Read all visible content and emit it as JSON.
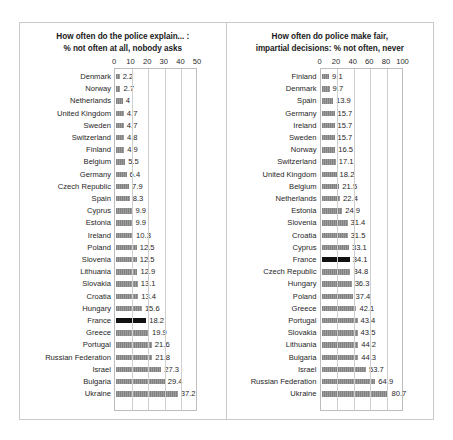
{
  "chart_data": [
    {
      "type": "bar",
      "orientation": "horizontal",
      "title": "How often do the police explain... : % not often at all, nobody asks",
      "title_lines": [
        "How often do the police explain... :",
        "% not often at all, nobody asks"
      ],
      "xlabel": "",
      "ylabel": "",
      "xlim": [
        0,
        50
      ],
      "xticks": [
        0,
        10,
        20,
        30,
        40,
        50
      ],
      "grid": true,
      "legend": "none",
      "highlight_category": "France",
      "highlight_color": "#111111",
      "bar_color": "#8e8e8e",
      "categories": [
        "Denmark",
        "Norway",
        "Netherlands",
        "United Kingdom",
        "Sweden",
        "Switzerland",
        "Finland",
        "Belgium",
        "Germany",
        "Czech Republic",
        "Spain",
        "Cyprus",
        "Estonia",
        "Ireland",
        "Poland",
        "Slovenia",
        "Lithuania",
        "Slovakia",
        "Croatia",
        "Hungary",
        "France",
        "Greece",
        "Portugal",
        "Russian Federation",
        "Israel",
        "Bulgaria",
        "Ukraine"
      ],
      "values": [
        2.2,
        2.7,
        4,
        4.7,
        4.7,
        4.8,
        4.9,
        5.5,
        6.4,
        7.9,
        8.3,
        9.9,
        9.9,
        10.3,
        12.5,
        12.5,
        12.9,
        13.1,
        13.4,
        15.6,
        18.2,
        19.9,
        21.6,
        21.8,
        27.3,
        29.4,
        37.2
      ],
      "labels": [
        "2.2",
        "2.7",
        "4",
        "4.7",
        "4.7",
        "4.8",
        "4.9",
        "5.5",
        "6.4",
        "7.9",
        "8.3",
        "9.9",
        "9.9",
        "10.3",
        "12.5",
        "12.5",
        "12.9",
        "13.1",
        "13.4",
        "15.6",
        "18.2",
        "19.9",
        "21.6",
        "21.8",
        "27.3",
        "29.4",
        "37.2"
      ]
    },
    {
      "type": "bar",
      "orientation": "horizontal",
      "title": "How often do police make fair, impartial decisions: % not often, never",
      "title_lines": [
        "How often do police make fair,",
        "impartial decisions: % not often, never"
      ],
      "xlabel": "",
      "ylabel": "",
      "xlim": [
        0,
        100
      ],
      "xticks": [
        0,
        20,
        40,
        60,
        80,
        100
      ],
      "grid": true,
      "legend": "none",
      "highlight_category": "France",
      "highlight_color": "#111111",
      "bar_color": "#8e8e8e",
      "categories": [
        "Finland",
        "Denmark",
        "Spain",
        "Germany",
        "Ireland",
        "Sweden",
        "Norway",
        "Switzerland",
        "United Kingdom",
        "Belgium",
        "Netherlands",
        "Estonia",
        "Slovenia",
        "Croatia",
        "Cyprus",
        "France",
        "Czech Republic",
        "Hungary",
        "Poland",
        "Greece",
        "Portugal",
        "Slovakia",
        "Lithuania",
        "Bulgaria",
        "Israel",
        "Russian Federation",
        "Ukraine"
      ],
      "values": [
        9.1,
        9.7,
        13.9,
        15.7,
        15.7,
        15.7,
        16.5,
        17.1,
        18.2,
        21.5,
        22.4,
        24.9,
        31.4,
        31.5,
        33.1,
        34.1,
        34.8,
        36.3,
        37.4,
        42.1,
        43.4,
        43.5,
        44.2,
        44.3,
        53.7,
        64.9,
        80.7
      ],
      "labels": [
        "9.1",
        "9.7",
        "13.9",
        "15.7",
        "15.7",
        "15.7",
        "16.5",
        "17.1",
        "18.2",
        "21.5",
        "22.4",
        "24.9",
        "31.4",
        "31.5",
        "33.1",
        "34.1",
        "34.8",
        "36.3",
        "37.4",
        "42.1",
        "43.4",
        "43.5",
        "44.2",
        "44.3",
        "53.7",
        "64.9",
        "80.7"
      ]
    }
  ]
}
